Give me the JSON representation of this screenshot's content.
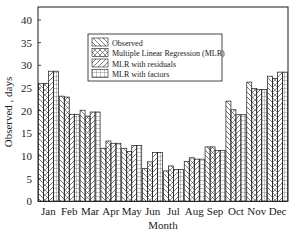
{
  "chart_data": {
    "type": "bar",
    "title": "",
    "xlabel": "Month",
    "ylabel": "Observed , days",
    "ylim": [
      0,
      40
    ],
    "yticks": [
      0,
      5,
      10,
      15,
      20,
      25,
      30,
      35,
      40
    ],
    "grid": false,
    "legend_position": "upper center (inside plot)",
    "categories": [
      "Jan",
      "Feb",
      "Mar",
      "Apr",
      "May",
      "Jun",
      "Jul",
      "Aug",
      "Sep",
      "Oct",
      "Nov",
      "Dec"
    ],
    "series": [
      {
        "name": "Observed",
        "pattern": "back-diagonal-hatch",
        "values": [
          26.0,
          23.2,
          20.1,
          11.7,
          11.7,
          7.2,
          6.7,
          8.8,
          12.0,
          22.1,
          26.3,
          27.6
        ]
      },
      {
        "name": "Multiple Linear Regression (MLR)",
        "pattern": "cross-diamond-hatch",
        "values": [
          26.0,
          23.0,
          18.8,
          13.3,
          11.0,
          8.7,
          7.8,
          9.6,
          12.0,
          20.2,
          24.9,
          27.1
        ]
      },
      {
        "name": "MLR with residuals",
        "pattern": "forward-diagonal-hatch",
        "values": [
          28.7,
          19.2,
          19.7,
          12.8,
          12.3,
          10.8,
          7.0,
          9.3,
          11.2,
          19.1,
          24.7,
          28.5
        ]
      },
      {
        "name": "MLR with factors",
        "pattern": "grid-hatch",
        "values": [
          28.7,
          19.2,
          19.7,
          12.8,
          12.3,
          10.8,
          7.0,
          9.3,
          11.2,
          19.1,
          24.7,
          28.5
        ]
      }
    ]
  },
  "colors": {
    "stroke": "#1a1a1a",
    "background": "#ffffff"
  }
}
